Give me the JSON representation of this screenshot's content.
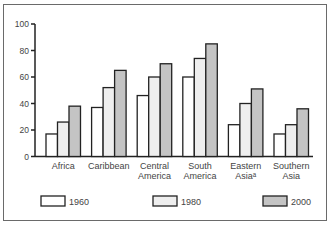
{
  "chart_data": {
    "type": "bar",
    "title": "",
    "xlabel": "",
    "ylabel": "",
    "ylim": [
      0,
      100
    ],
    "yticks": [
      0,
      20,
      40,
      60,
      80,
      100
    ],
    "categories": [
      [
        "Africa"
      ],
      [
        "Caribbean"
      ],
      [
        "Central",
        "America"
      ],
      [
        "South",
        "America"
      ],
      [
        "Eastern",
        "Asiaᵃ"
      ],
      [
        "Southern",
        "Asia"
      ]
    ],
    "series": [
      {
        "name": "1960",
        "color": "#ffffff",
        "values": [
          17,
          37,
          46,
          60,
          24,
          17
        ]
      },
      {
        "name": "1980",
        "color": "#eeeeee",
        "values": [
          26,
          52,
          60,
          74,
          40,
          24
        ]
      },
      {
        "name": "2000",
        "color": "#c4c4c4",
        "values": [
          38,
          65,
          70,
          85,
          51,
          36
        ]
      }
    ],
    "grid": false,
    "legend": "bottom"
  }
}
